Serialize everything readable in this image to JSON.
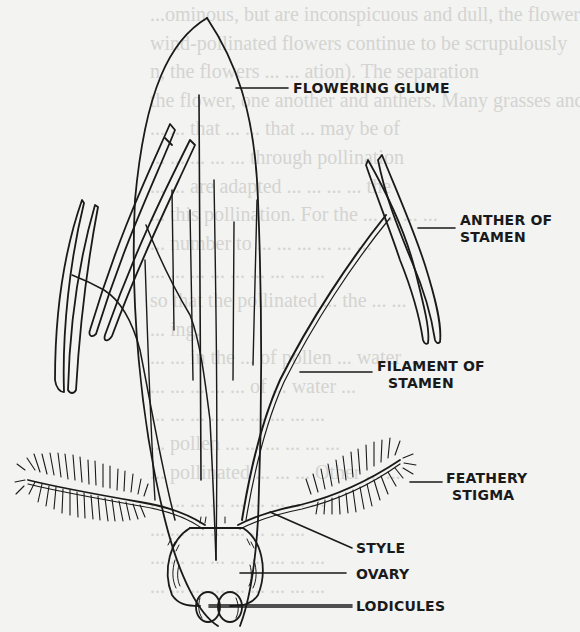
{
  "diagram": {
    "labels": {
      "flowering_glume": "FLOWERING GLUME",
      "anther_line1": "ANTHER OF",
      "anther_line2": "STAMEN",
      "filament_line1": "FILAMENT OF",
      "filament_line2": "STAMEN",
      "stigma_line1": "FEATHERY",
      "stigma_line2": "STIGMA",
      "style": "STYLE",
      "ovary": "OVARY",
      "lodicules": "LODICULES"
    },
    "colors": {
      "background": "#f3f3f1",
      "ink": "#1a1a1a",
      "show_through_text": "#d4d4d2"
    }
  },
  "background_text": {
    "lines": [
      "...ominous, but are inconspicuous and dull, the flowers",
      "wind-pollinated flowers continue to be scrupulously",
      "n, the flowers ...  ... ation).  The separation",
      "the flower, one another and anthers.  Many grasses and",
      "...  ... that ...  ... that ... may be of",
      "...  ... ... ... ... through pollination",
      "... ... are adapted ... ... ... ... the",
      "... this pollination.  For the ... ... ... ...",
      "...  number to ... ... ... ... ... ...",
      "...  ... ... ... ... ... ... ... ...",
      "so that the pollinated ... the ... ...",
      "... ing.",
      "... ... in the ... of pollen ... water ...",
      "... ... ... ... ... of ... water ...",
      "... ... ... ... ... ... ... ... ...",
      "... pollen ... ... ... ... ... ...",
      "... pollinated ... ... ... Other ... ...",
      "... ... ... ... ... ... ... ... ...",
      "... ... ... ... ... ... ... ...",
      "... ... ... ... ... ... ... ... ...",
      "... ... ... ... ... ... ... ... ..."
    ]
  }
}
